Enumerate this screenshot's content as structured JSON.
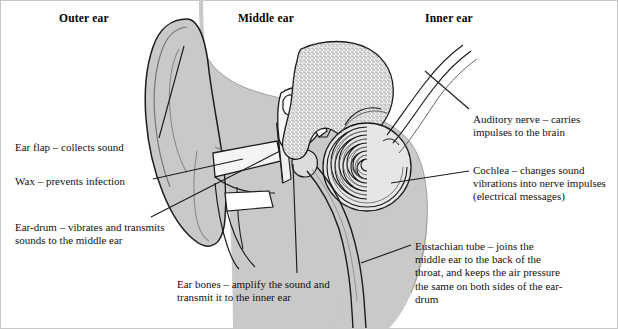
{
  "figure": {
    "background_color": "#ffffff",
    "head_fill_color": "#c9c9c9",
    "bone_fill_color": "#e8e8e8",
    "line_color": "#111111"
  },
  "headings": {
    "outer": "Outer ear",
    "middle": "Middle ear",
    "inner": "Inner ear"
  },
  "callouts": {
    "ear_flap": "Ear flap – collects sound",
    "wax": "Wax – prevents infection",
    "ear_drum": "Ear-drum – vibrates and transmits sounds to the middle ear",
    "ear_bones": "Ear bones – amplify the sound and transmit it to the inner ear",
    "auditory_nerve": "Auditory nerve – carries impulses to the brain",
    "cochlea": "Cochlea – changes sound vibrations into nerve impulses (electrical messages)",
    "eustachian_tube": "Eustachian tube – joins the middle ear to the back of the throat, and keeps the air pressure the same on both sides of the ear-drum"
  }
}
